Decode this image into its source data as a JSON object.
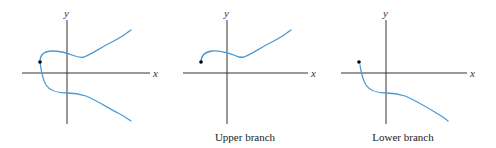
{
  "figure": {
    "panels": [
      {
        "id": "full-curve",
        "caption": "",
        "x_axis_label": "x",
        "y_axis_label": "y",
        "branches": [
          "upper",
          "lower"
        ],
        "start_point": "dot at leftmost point of curve"
      },
      {
        "id": "upper-branch",
        "caption": "Upper branch",
        "x_axis_label": "x",
        "y_axis_label": "y",
        "branches": [
          "upper"
        ],
        "start_point": "dot at left end of branch"
      },
      {
        "id": "lower-branch",
        "caption": "Lower branch",
        "x_axis_label": "x",
        "y_axis_label": "y",
        "branches": [
          "lower"
        ],
        "start_point": "dot at left end of branch"
      }
    ],
    "colors": {
      "curve": "#4a9bd4",
      "axis": "#333333",
      "dot": "#000000"
    }
  }
}
